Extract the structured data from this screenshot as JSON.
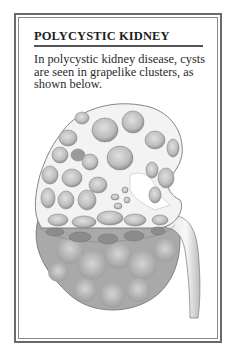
{
  "panel": {
    "title": "POLYCYSTIC KIDNEY",
    "body_lines": [
      "In polycystic kidney disease, cysts",
      "are seen in grapelike clusters, as",
      "shown below."
    ],
    "illustration": {
      "subject": "polycystic-kidney-cross-section",
      "colors": {
        "tissue": "#f2f2f2",
        "cyst": "#c9c9c9",
        "cyst_shadow": "#9e9e9e",
        "outer_surface": "#a8a8a8",
        "outline": "#6e6e6e"
      }
    }
  }
}
